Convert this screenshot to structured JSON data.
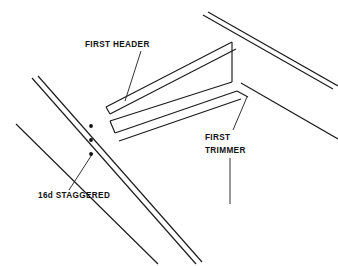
{
  "drawing": {
    "type": "isometric-line-drawing",
    "subject": "floor framing opening detail",
    "background_color": "#ffffff",
    "line_color": "#1a1a1a",
    "canvas": {
      "width": 338,
      "height": 266
    }
  },
  "labels": {
    "first_header": {
      "text": "FIRST HEADER",
      "x": 85,
      "y": 47,
      "leader": {
        "x1": 140,
        "y1": 50,
        "x2": 126,
        "y2": 100
      }
    },
    "first_trimmer": {
      "line1": "FIRST",
      "line2": "TRIMMER",
      "x": 205,
      "y1": 139,
      "y2": 152,
      "leader_upper": {
        "x1": 233,
        "y1": 130,
        "x2": 246,
        "y2": 98
      },
      "leader_lower": {
        "x1": 230,
        "y1": 157,
        "x2": 230,
        "y2": 204
      }
    },
    "nail_spec": {
      "text": "16d STAGGERED",
      "x": 38,
      "y": 198,
      "leader": {
        "x1": 70,
        "y1": 190,
        "x2": 93,
        "y2": 155
      }
    }
  },
  "nails": {
    "name": "16d staggered nails",
    "count": 3,
    "dots": [
      {
        "cx": 91,
        "cy": 126,
        "r": 1.9
      },
      {
        "cx": 91,
        "cy": 140,
        "r": 1.9
      },
      {
        "cx": 91,
        "cy": 154,
        "r": 1.9
      }
    ]
  },
  "members": {
    "left_joist": {
      "name": "left joist",
      "edge_top": {
        "x1": 32,
        "y1": 78,
        "x2": 194,
        "y2": 262
      },
      "edge_bottom": {
        "x1": 37,
        "y1": 77,
        "x2": 199,
        "y2": 261
      },
      "lower_parallel": {
        "x1": 16,
        "y1": 124,
        "x2": 156,
        "y2": 262
      }
    },
    "right_joist": {
      "name": "right joist",
      "edge_top": {
        "x1": 203,
        "y1": 14,
        "x2": 334,
        "y2": 88
      },
      "edge_bottom": {
        "x1": 207,
        "y1": 12,
        "x2": 338,
        "y2": 86
      },
      "lower_parallel": {
        "x1": 240,
        "y1": 82,
        "x2": 338,
        "y2": 138
      }
    },
    "first_header": {
      "name": "first header beam",
      "top_far": {
        "x1": 106,
        "y1": 107,
        "x2": 232,
        "y2": 42
      },
      "top_near": {
        "x1": 109,
        "y1": 113,
        "x2": 235,
        "y2": 48
      },
      "bottom_near": {
        "x1": 109,
        "y1": 124,
        "x2": 235,
        "y2": 59
      },
      "end_face": {
        "x1": 232,
        "y1": 42,
        "x2": 232,
        "y2": 82
      }
    },
    "first_trimmer": {
      "name": "first trimmer beam",
      "top_far": {
        "x1": 111,
        "y1": 124,
        "x2": 232,
        "y2": 82
      },
      "top_near": {
        "x1": 115,
        "y1": 133,
        "x2": 236,
        "y2": 90
      },
      "bottom_near": {
        "x1": 118,
        "y1": 141,
        "x2": 239,
        "y2": 99
      },
      "left_end": {
        "x1": 111,
        "y1": 124,
        "x2": 115,
        "y2": 133
      }
    },
    "opening_edges": {
      "name": "opening face lines",
      "header_face_left": {
        "x1": 106,
        "y1": 107,
        "x2": 109,
        "y2": 124
      },
      "trimmer_to_joist": {
        "x1": 236,
        "y1": 90,
        "x2": 248,
        "y2": 96
      }
    }
  }
}
